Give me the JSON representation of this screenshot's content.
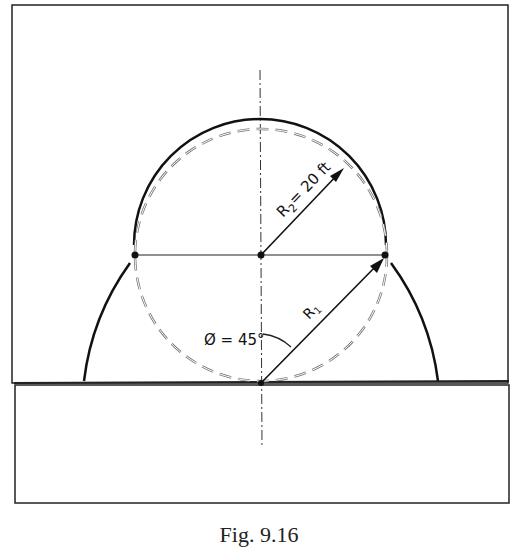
{
  "diagram": {
    "labels": {
      "r2": "R",
      "r2_sub": "2",
      "r2_value": "= 20 ft",
      "r1": "R",
      "r1_sub": "1",
      "angle": "Ø = 45°"
    },
    "caption": "Fig. 9.16",
    "colors": {
      "stroke": "#1a1a1a",
      "dashed": "#777777",
      "background": "#ffffff"
    }
  }
}
